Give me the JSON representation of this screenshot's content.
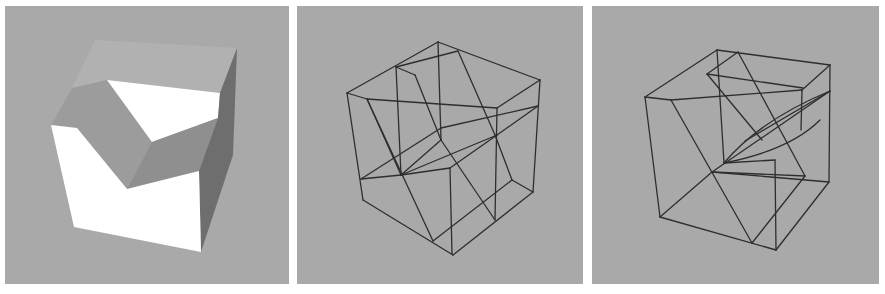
{
  "figure": {
    "panels": [
      {
        "id": "shaded",
        "description": "Shaded 3D solid: cube with a V-shaped notch cut into it"
      },
      {
        "id": "wireframe-1",
        "description": "Wireframe view of cube cut by intersecting planes"
      },
      {
        "id": "wireframe-2",
        "description": "Wireframe view of cube from a different viewpoint with curved section"
      }
    ],
    "colors": {
      "background": "#a9a9a9",
      "lit_face": "#ffffff",
      "mid_face": "#8f8f8f",
      "dark_face": "#6e6e6e",
      "top_face": "#b1b1b1",
      "wire": "#2e2e2e"
    }
  }
}
